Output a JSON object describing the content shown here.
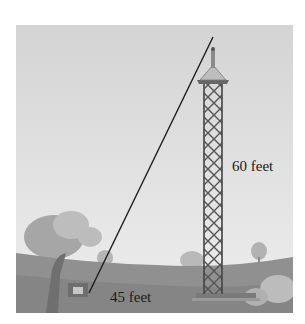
{
  "figure": {
    "labels": {
      "height": "60 feet",
      "base": "45 feet"
    },
    "objects": {
      "tower": "lattice tower",
      "wire": "guy wire",
      "anchor": "ground anchor"
    },
    "colors": {
      "sky_top": "#d6d6d6",
      "sky_bottom": "#ececec",
      "ground": "#8c8c8c",
      "hills": "#a3a3a3",
      "tower": "#555555",
      "wire": "#1e1e1e"
    }
  }
}
